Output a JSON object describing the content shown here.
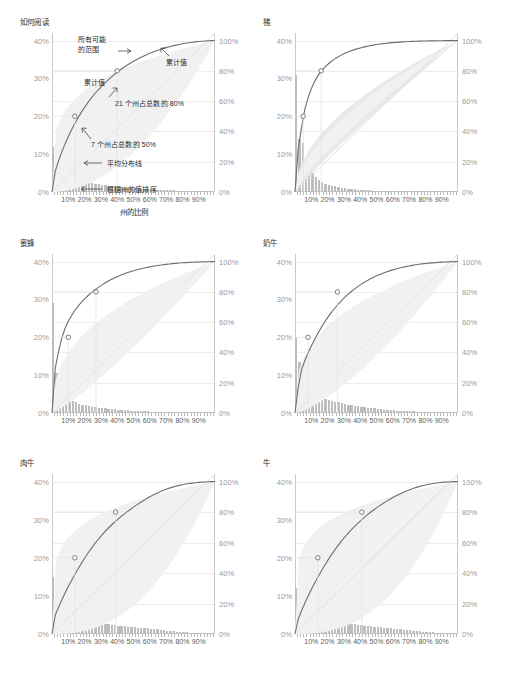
{
  "figure": {
    "xaxis_label": "州的比例",
    "xticks": [
      "10%",
      "20%",
      "30%",
      "40%",
      "50%",
      "60%",
      "70%",
      "80%",
      "90%"
    ],
    "xtick_values": [
      10,
      20,
      30,
      40,
      50,
      60,
      70,
      80,
      90
    ],
    "yticks_left": [
      "0%",
      "10%",
      "20%",
      "30%",
      "40%"
    ],
    "ytick_left_values": [
      0,
      10,
      20,
      30,
      40
    ],
    "yticks_right": [
      "0%",
      "20%",
      "40%",
      "60%",
      "80%",
      "100%"
    ],
    "ytick_right_values": [
      0,
      20,
      40,
      60,
      80,
      100
    ],
    "colors": {
      "bar": "#bdbdbd",
      "curve": "#6e6e6e",
      "band": "#e9e9e9",
      "band_inner": "#f1f1f1",
      "diagonal": "#e2e2e2",
      "gridline": "#ededed",
      "axis": "#c9c9c9",
      "tick_label": "#9a9a9a",
      "marker_fill": "#ffffff"
    }
  },
  "annotations": {
    "range_label": "所有可能\n的范围",
    "cumulative_label_left": "累计值",
    "cumulative_label_right": "累计值",
    "pct80_label": "21 个州占总数的 80%",
    "pct50_label": "7 个州占总数的 50%",
    "average_line_label": "平均分布线",
    "sorted_label": "根据州的值排序"
  },
  "chart_data": {
    "type": "line",
    "title": "如何阅读",
    "xlabel": "州的比例",
    "ylabel_left": "各州份额",
    "ylabel_right": "累计份额",
    "xlim": [
      0,
      100
    ],
    "ylim_left": [
      0,
      42
    ],
    "ylim_right": [
      0,
      105
    ],
    "grid": true,
    "legend": "none",
    "panels": [
      {
        "title": "如何阅读",
        "is_legend_panel": true,
        "marker_50": {
          "x": 14,
          "y": 50,
          "label": "7 个州占总数的 50%"
        },
        "marker_80": {
          "x": 40,
          "y": 80,
          "label": "21 个州占总数的 80%"
        },
        "first_bar": 12.0,
        "bars": [
          12.0,
          5.8,
          5.2,
          4.6,
          4.2,
          3.9,
          3.6,
          3.3,
          3.1,
          2.9,
          2.7,
          2.5,
          2.3,
          2.15,
          2.0,
          1.9,
          1.8,
          1.7,
          1.6,
          1.5,
          1.4,
          1.32,
          1.25,
          1.18,
          1.1,
          1.04,
          0.98,
          0.92,
          0.86,
          0.8,
          0.75,
          0.7,
          0.65,
          0.6,
          0.56,
          0.52,
          0.48,
          0.44,
          0.4,
          0.36,
          0.32,
          0.29,
          0.26,
          0.23,
          0.2,
          0.17,
          0.14,
          0.11,
          0.08,
          0.05
        ]
      },
      {
        "title": "猪",
        "marker_50": {
          "x": 5,
          "y": 50
        },
        "marker_80": {
          "x": 16,
          "y": 80
        },
        "first_bar": 31.0,
        "bars": [
          31.0,
          14.0,
          13.0,
          8.0,
          6.4,
          5.0,
          4.0,
          3.2,
          2.6,
          2.2,
          1.9,
          1.7,
          1.5,
          1.3,
          1.15,
          1.0,
          0.9,
          0.8,
          0.72,
          0.65,
          0.58,
          0.52,
          0.47,
          0.42,
          0.38,
          0.34,
          0.3,
          0.27,
          0.24,
          0.21,
          0.19,
          0.17,
          0.15,
          0.13,
          0.115,
          0.1,
          0.09,
          0.08,
          0.07,
          0.06,
          0.05,
          0.045,
          0.04,
          0.035,
          0.03,
          0.025,
          0.02,
          0.015,
          0.01,
          0.008
        ]
      },
      {
        "title": "蜜蜂",
        "marker_50": {
          "x": 10,
          "y": 50
        },
        "marker_80": {
          "x": 27,
          "y": 80
        },
        "first_bar": 29.0,
        "bars": [
          29.0,
          10.5,
          9.0,
          6.0,
          4.6,
          3.8,
          3.2,
          2.8,
          2.5,
          2.2,
          2.0,
          1.85,
          1.7,
          1.55,
          1.45,
          1.35,
          1.25,
          1.15,
          1.05,
          0.97,
          0.9,
          0.83,
          0.76,
          0.7,
          0.64,
          0.59,
          0.54,
          0.5,
          0.46,
          0.42,
          0.38,
          0.35,
          0.32,
          0.29,
          0.26,
          0.24,
          0.22,
          0.2,
          0.18,
          0.16,
          0.14,
          0.125,
          0.11,
          0.095,
          0.08,
          0.07,
          0.06,
          0.05,
          0.04,
          0.03
        ]
      },
      {
        "title": "奶牛",
        "marker_50": {
          "x": 8,
          "y": 50
        },
        "marker_80": {
          "x": 26,
          "y": 80
        },
        "first_bar": 20.0,
        "bars": [
          20.0,
          13.5,
          7.0,
          6.0,
          5.4,
          5.0,
          4.7,
          4.4,
          4.1,
          3.8,
          3.5,
          3.2,
          3.0,
          2.8,
          2.6,
          2.4,
          2.2,
          2.05,
          1.9,
          1.75,
          1.6,
          1.5,
          1.4,
          1.3,
          1.2,
          1.1,
          1.0,
          0.92,
          0.85,
          0.78,
          0.72,
          0.66,
          0.6,
          0.55,
          0.5,
          0.46,
          0.42,
          0.38,
          0.34,
          0.3,
          0.27,
          0.24,
          0.21,
          0.18,
          0.15,
          0.13,
          0.11,
          0.09,
          0.07,
          0.05
        ]
      },
      {
        "title": "肉牛",
        "marker_50": {
          "x": 14,
          "y": 50
        },
        "marker_80": {
          "x": 39,
          "y": 80
        },
        "first_bar": 15.0,
        "bars": [
          15.0,
          6.2,
          5.8,
          5.4,
          5.1,
          4.9,
          4.7,
          4.5,
          4.3,
          4.1,
          3.9,
          3.7,
          3.5,
          3.3,
          3.1,
          2.9,
          2.7,
          2.55,
          2.4,
          2.3,
          2.2,
          2.1,
          2.0,
          1.92,
          1.85,
          1.78,
          1.7,
          1.62,
          1.55,
          1.48,
          1.4,
          1.3,
          1.2,
          1.1,
          1.0,
          0.9,
          0.8,
          0.72,
          0.64,
          0.56,
          0.48,
          0.42,
          0.36,
          0.3,
          0.25,
          0.2,
          0.16,
          0.12,
          0.08,
          0.05
        ]
      },
      {
        "title": "牛",
        "marker_50": {
          "x": 14,
          "y": 50
        },
        "marker_80": {
          "x": 41,
          "y": 80
        },
        "first_bar": 12.0,
        "bars": [
          12.0,
          6.5,
          6.0,
          5.6,
          5.3,
          5.0,
          4.8,
          4.6,
          4.4,
          4.2,
          4.0,
          3.8,
          3.6,
          3.4,
          3.2,
          3.0,
          2.85,
          2.7,
          2.55,
          2.4,
          2.3,
          2.2,
          2.1,
          2.0,
          1.9,
          1.8,
          1.72,
          1.64,
          1.56,
          1.48,
          1.4,
          1.3,
          1.22,
          1.14,
          1.05,
          0.96,
          0.87,
          0.78,
          0.7,
          0.62,
          0.54,
          0.46,
          0.4,
          0.34,
          0.28,
          0.22,
          0.17,
          0.12,
          0.08,
          0.05
        ]
      }
    ]
  }
}
